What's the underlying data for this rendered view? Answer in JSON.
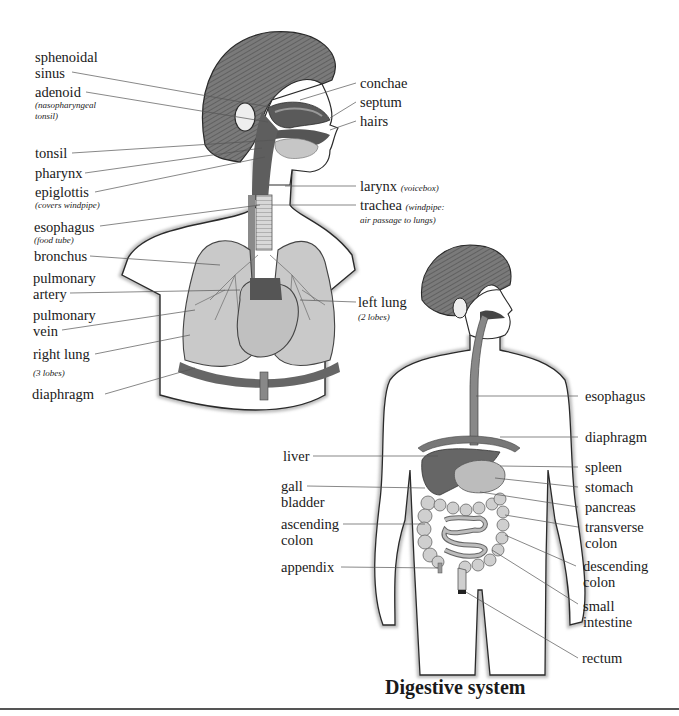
{
  "respiratory": {
    "labels": {
      "sphenoidal_sinus": "sphenoidal\nsinus",
      "sphenoidal_l1": "sphenoidal",
      "sphenoidal_l2": "sinus",
      "adenoid": "adenoid",
      "adenoid_note": "(nasopharyngeal tonsil)",
      "adenoid_note_l1": "(nasopharyngeal",
      "adenoid_note_l2": "tonsil)",
      "tonsil": "tonsil",
      "pharynx": "pharynx",
      "epiglottis": "epiglottis",
      "epiglottis_note": "(covers windpipe)",
      "esophagus": "esophagus",
      "esophagus_note": "(food tube)",
      "bronchus": "bronchus",
      "pulmonary_artery_l1": "pulmonary",
      "pulmonary_artery_l2": "artery",
      "pulmonary_vein_l1": "pulmonary",
      "pulmonary_vein_l2": "vein",
      "right_lung": "right lung",
      "right_lung_note": "(3 lobes)",
      "diaphragm": "diaphragm",
      "conchae": "conchae",
      "septum": "septum",
      "hairs": "hairs",
      "larynx": "larynx",
      "larynx_note": "(voicebox)",
      "trachea": "trachea",
      "trachea_note_l1": "(windpipe:",
      "trachea_note_l2": "air passage to lungs)",
      "left_lung": "left lung",
      "left_lung_note": "(2 lobes)"
    }
  },
  "digestive": {
    "title": "Digestive system",
    "labels": {
      "liver": "liver",
      "gall_l1": "gall",
      "gall_l2": "bladder",
      "ascending_l1": "ascending",
      "ascending_l2": "colon",
      "appendix": "appendix",
      "esophagus": "esophagus",
      "diaphragm": "diaphragm",
      "spleen": "spleen",
      "stomach": "stomach",
      "pancreas": "pancreas",
      "transverse_l1": "transverse",
      "transverse_l2": "colon",
      "descending_l1": "descending",
      "descending_l2": "colon",
      "small_l1": "small",
      "small_l2": "intestine",
      "rectum": "rectum"
    }
  },
  "colors": {
    "outline": "#2a2a2a",
    "hair": "#6e6e6e",
    "organ_dark": "#5a5a5a",
    "organ_mid": "#8a8a8a",
    "organ_light": "#c4c4c4",
    "leader_line": "#555555"
  }
}
